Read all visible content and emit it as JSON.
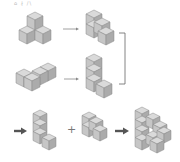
{
  "header": {
    "caption": "⌂ ∤ /\\"
  },
  "colors": {
    "top": "#d9d9d9",
    "left": "#c4c4c4",
    "right": "#aaaaaa",
    "edge": "#8a8a8a",
    "arrow_thin": "#777777",
    "arrow_bold": "#555555",
    "bracket": "#666666"
  },
  "symbols": {
    "plus": "+"
  },
  "rows": [
    {
      "id": "row1",
      "from": "three-cube pyramid",
      "to": "stepped 4-cube piece"
    },
    {
      "id": "row2",
      "from": "flat L of 4 cubes",
      "to": "vertical L (3 tall + 1)"
    },
    {
      "id": "row3",
      "parts": [
        "vertical L piece",
        "stepped piece",
        "combined staircase assembly"
      ]
    }
  ]
}
